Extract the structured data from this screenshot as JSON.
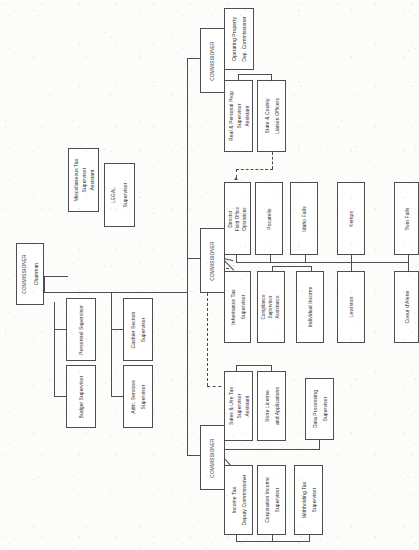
{
  "document": {
    "type": "organization-chart",
    "orientation": "rotated-90-counterclockwise",
    "title": "State Tax Commission Organization Chart"
  },
  "colors": {
    "paper": "#fcfcfb",
    "ink": "#2a2a2a",
    "rule": "#4e4e4e"
  },
  "nodes": {
    "chairman": {
      "line1": "COMMISSIONER",
      "line2": "Chairman"
    },
    "misc_tax": {
      "line1": "Miscellaneous Tax",
      "line2": "Supervisor",
      "line3": "Assistant"
    },
    "legal": {
      "line1": "LEGAL",
      "line2": "Supervisor"
    },
    "budget": {
      "line1": "Budget  Supervisor"
    },
    "personnel": {
      "line1": "Personnel  Supervisor"
    },
    "adm_services": {
      "line1": "Adm. Services",
      "line2": "Supervisor"
    },
    "cashier": {
      "line1": "Cashier   Section",
      "line2": "Supervisor"
    },
    "commissioner_top": {
      "line1": "COMMISSIONER"
    },
    "operating_property": {
      "line1": "Operating Property",
      "line2": "Dep.  Commissioner"
    },
    "real_personal_prop": {
      "line1": "Real  &   Personal Prop",
      "line2": "Supervisor",
      "line3": "Assistant"
    },
    "state_county": {
      "line1": "State & County",
      "line2": "Liaison Officers"
    },
    "commissioner_mid": {
      "line1": "COMMISSIONER"
    },
    "director_field": {
      "line1": "Director",
      "line2": "Field Office",
      "line3": "Operations"
    },
    "pocatello": {
      "line1": "Pocatello"
    },
    "idaho_falls": {
      "line1": "Idaho Falls"
    },
    "kemps": {
      "line1": "Kemps"
    },
    "twin_falls": {
      "line1": "Twin Falls"
    },
    "inheritance_tax": {
      "line1": "Inheritance Tax",
      "line2": "Supervisor"
    },
    "compliance": {
      "line1": "Compliance",
      "line2": "Supervisor",
      "line3": "Assistance"
    },
    "individual_income": {
      "line1": "Individual Income"
    },
    "lewiston": {
      "line1": "Lewiston"
    },
    "coeur_dalene": {
      "line1": "Coeur d'Alene"
    },
    "commissioner_bot": {
      "line1": "COMMISSIONER"
    },
    "sales_use_tax": {
      "line1": "Sales  &  Use Tax",
      "line2": "Supervisor",
      "line3": "Assistant"
    },
    "store_license": {
      "line1": "Store   License",
      "line2": "and   Applications"
    },
    "data_processing": {
      "line1": "Data  Processing",
      "line2": "Supervisor"
    },
    "income_tax": {
      "line1": "Income  Tax",
      "line2": "Deputy Commissioner"
    },
    "corporation_income": {
      "line1": "Corporation Income",
      "line2": "Supervisor"
    },
    "withholding_tax": {
      "line1": "Withholding Tax",
      "line2": "Supervisor"
    }
  }
}
